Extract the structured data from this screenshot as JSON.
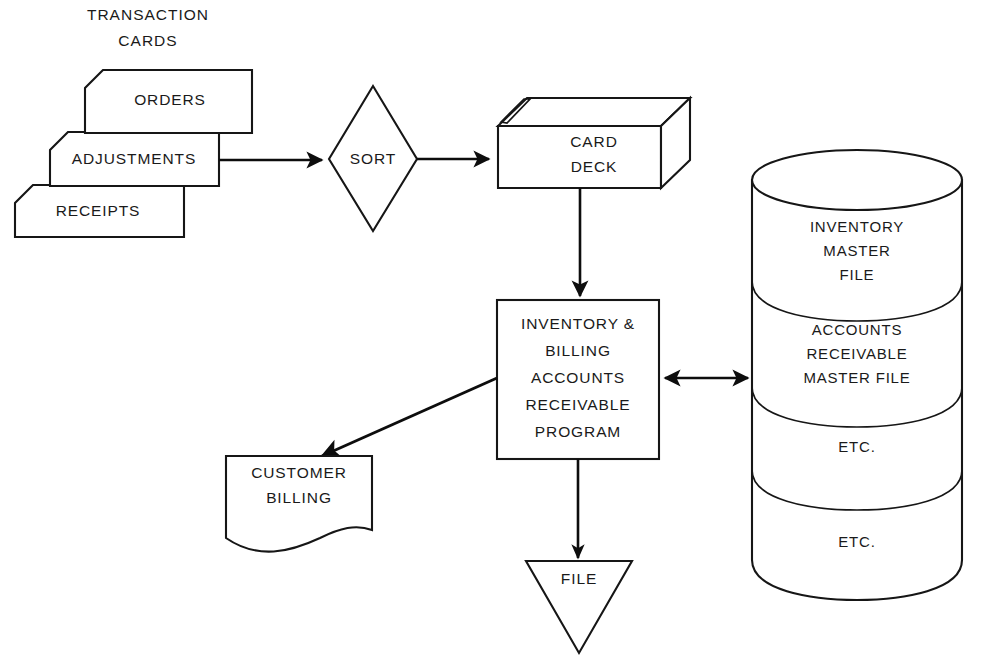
{
  "diagram": {
    "background_color": "#ffffff",
    "line_color": "#161616",
    "text_color": "#1a1a1a",
    "header": {
      "line1": "TRANSACTION",
      "line2": "CARDS"
    },
    "cards": [
      {
        "id": "orders",
        "label": "ORDERS"
      },
      {
        "id": "adjustments",
        "label": "ADJUSTMENTS"
      },
      {
        "id": "receipts",
        "label": "RECEIPTS"
      }
    ],
    "sort": {
      "label": "SORT",
      "shape": "diamond"
    },
    "card_deck": {
      "shape": "3d-box",
      "line1": "CARD",
      "line2": "DECK"
    },
    "program": {
      "shape": "rectangle",
      "lines": [
        "INVENTORY &",
        "BILLING",
        "ACCOUNTS",
        "RECEIVABLE",
        "PROGRAM"
      ]
    },
    "document": {
      "shape": "document",
      "line1": "CUSTOMER",
      "line2": "BILLING"
    },
    "file": {
      "shape": "inverted-triangle",
      "label": "FILE"
    },
    "disk_stack": {
      "shape": "stacked-cylinders",
      "segments": [
        {
          "id": "inventory-master",
          "lines": [
            "INVENTORY",
            "MASTER",
            "FILE"
          ]
        },
        {
          "id": "accounts-receivable-master",
          "lines": [
            "ACCOUNTS",
            "RECEIVABLE",
            "MASTER FILE"
          ]
        },
        {
          "id": "etc-1",
          "lines": [
            "ETC."
          ]
        },
        {
          "id": "etc-2",
          "lines": [
            "ETC."
          ]
        }
      ]
    },
    "connectors": [
      {
        "id": "cards-to-sort",
        "from": "adjustments",
        "to": "sort",
        "direction": "one-way"
      },
      {
        "id": "sort-to-deck",
        "from": "sort",
        "to": "card_deck",
        "direction": "one-way"
      },
      {
        "id": "deck-to-program",
        "from": "card_deck",
        "to": "program",
        "direction": "one-way"
      },
      {
        "id": "program-to-disks",
        "from": "program",
        "to": "disk_stack",
        "direction": "two-way"
      },
      {
        "id": "program-to-document",
        "from": "program",
        "to": "document",
        "direction": "one-way"
      },
      {
        "id": "program-to-file",
        "from": "program",
        "to": "file",
        "direction": "one-way"
      }
    ]
  }
}
